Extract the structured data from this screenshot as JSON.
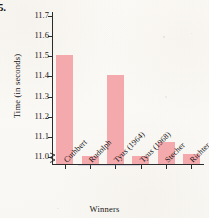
{
  "problem_number": "5.",
  "chart_data": {
    "type": "bar",
    "title": "",
    "xlabel": "Winners",
    "ylabel": "Time (in seconds)",
    "categories": [
      "Cuthbert",
      "Rudolph",
      "Tyus (1964)",
      "Tyus (1968)",
      "Stecher",
      "Richter"
    ],
    "values": [
      11.5,
      11.0,
      11.4,
      11.0,
      11.07,
      11.01
    ],
    "ylim": [
      10.96,
      11.72
    ],
    "yticks": [
      "11.0",
      "11.1",
      "11.2",
      "11.3",
      "11.4",
      "11.5",
      "11.6",
      "11.7"
    ],
    "ytick_values": [
      11.0,
      11.1,
      11.2,
      11.3,
      11.4,
      11.5,
      11.6,
      11.7
    ],
    "axis_break": true,
    "grid": false,
    "legend": "none",
    "bar_color": "#f4a9ac",
    "axis_color": "#2b2b2b"
  }
}
